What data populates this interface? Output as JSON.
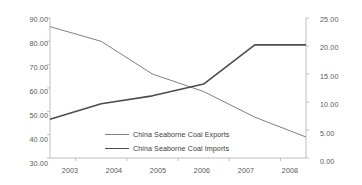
{
  "chart_data": {
    "type": "line",
    "title": "",
    "xlabel": "",
    "ylabel": "",
    "categories": [
      "2003",
      "2004",
      "2005",
      "2006",
      "2007",
      "2008"
    ],
    "x": [
      2003,
      2004,
      2005,
      2006,
      2007,
      2008
    ],
    "grid": false,
    "legend_position": "center",
    "axes": {
      "left": {
        "label": "",
        "ylim": [
          30.0,
          90.0
        ],
        "tick_step": 10.0,
        "ticks": [
          "30.00",
          "40.00",
          "50.00",
          "60.00",
          "70.00",
          "80.00",
          "90.00"
        ],
        "tick_values": [
          30.0,
          40.0,
          50.0,
          60.0,
          70.0,
          80.0,
          90.0
        ]
      },
      "right": {
        "label": "",
        "ylim": [
          0.0,
          25.0
        ],
        "tick_step": 5.0,
        "ticks": [
          "0.00",
          "5.00",
          "10.00",
          "15.00",
          "20.00",
          "25.00"
        ],
        "tick_values": [
          0.0,
          5.0,
          10.0,
          15.0,
          20.0,
          25.0
        ]
      }
    },
    "series": [
      {
        "name": "China Seaborne Coal Exports",
        "axis": "left",
        "color": "#808080",
        "line_width": 1.0,
        "values": [
          86.3,
          80.0,
          66.0,
          58.5,
          47.5,
          39.0
        ]
      },
      {
        "name": "China Seaborne Coal Imports",
        "axis": "right",
        "color": "#4d4d4d",
        "line_width": 1.6,
        "values": [
          6.9,
          9.7,
          11.1,
          13.2,
          20.2,
          20.2
        ]
      }
    ]
  },
  "legend": {
    "items": [
      {
        "label": "China Seaborne Coal Exports",
        "style": "exports"
      },
      {
        "label": "China Seaborne Coal Imports",
        "style": "imports"
      }
    ]
  },
  "colors": {
    "exports_line": "#808080",
    "imports_line": "#4d4d4d",
    "axis": "#bfbfbf",
    "tick_text": "#595959",
    "legend_text": "#404040",
    "background": "#ffffff"
  }
}
